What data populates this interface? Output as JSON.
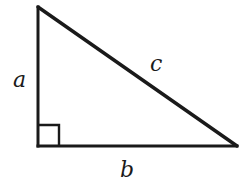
{
  "diagram": {
    "stroke_color": "#1a1a1a",
    "background": "#ffffff",
    "vertices": {
      "top": [
        38,
        7
      ],
      "right_angle": [
        38,
        146
      ],
      "right": [
        237,
        146
      ]
    },
    "right_angle_marker": {
      "x": 38,
      "y": 125,
      "size": 21
    },
    "labels": {
      "side_a": "a",
      "side_b": "b",
      "side_c": "c"
    }
  }
}
